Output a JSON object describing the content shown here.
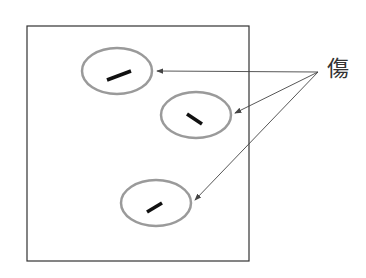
{
  "diagram": {
    "label": "傷",
    "colors": {
      "frame": "#333333",
      "ellipse_stroke": "#9a9a9a",
      "mark": "#111111",
      "arrow": "#444444"
    },
    "frame": {
      "x": 27,
      "y": 26,
      "w": 222,
      "h": 235
    },
    "arrow_origin": {
      "x": 318,
      "y": 72
    },
    "spots": [
      {
        "cx": 117,
        "cy": 71,
        "rx": 35,
        "ry": 23,
        "mark": [
          107,
          80,
          131,
          71
        ],
        "arrow_tip": [
          157,
          71
        ]
      },
      {
        "cx": 196,
        "cy": 115,
        "rx": 35,
        "ry": 23,
        "mark": [
          187,
          114,
          202,
          124
        ],
        "arrow_tip": [
          235,
          113
        ]
      },
      {
        "cx": 156,
        "cy": 203,
        "rx": 35,
        "ry": 23,
        "mark": [
          147,
          212,
          162,
          203
        ],
        "arrow_tip": [
          195,
          200
        ]
      }
    ]
  }
}
